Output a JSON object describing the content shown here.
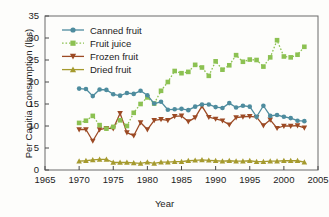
{
  "chart_data": {
    "type": "line",
    "title": "",
    "xlabel": "Year",
    "ylabel": "Per Capitia Consumption (lbs)",
    "xlim": [
      1965,
      2005
    ],
    "ylim": [
      0,
      35
    ],
    "xticks": [
      1965,
      1970,
      1975,
      1980,
      1985,
      1990,
      1995,
      2000,
      2005
    ],
    "yticks": [
      0,
      5,
      10,
      15,
      20,
      25,
      30,
      35
    ],
    "grid": false,
    "legend_position": "upper-left-inside",
    "x": [
      1970,
      1971,
      1972,
      1973,
      1974,
      1975,
      1976,
      1977,
      1978,
      1979,
      1980,
      1981,
      1982,
      1983,
      1984,
      1985,
      1986,
      1987,
      1988,
      1989,
      1990,
      1991,
      1992,
      1993,
      1994,
      1995,
      1996,
      1997,
      1998,
      1999,
      2000,
      2001,
      2002,
      2003
    ],
    "series": [
      {
        "name": "Canned fruit",
        "color": "#4e8c9e",
        "linestyle": "solid",
        "marker": "circle",
        "values": [
          18.5,
          18.4,
          16.8,
          18.3,
          18.2,
          17.2,
          16.9,
          17.5,
          17.3,
          18.0,
          17.0,
          15.1,
          15.5,
          13.7,
          13.8,
          13.9,
          13.6,
          14.4,
          14.9,
          14.9,
          14.3,
          14.1,
          15.2,
          14.2,
          14.6,
          14.4,
          12.1,
          14.6,
          12.3,
          12.5,
          12.1,
          11.8,
          11.2,
          11.1
        ]
      },
      {
        "name": "Fruit juice",
        "color": "#8cc152",
        "linestyle": "dotted",
        "marker": "square",
        "values": [
          10.7,
          11.2,
          12.3,
          10.2,
          9.4,
          9.8,
          11.3,
          10.0,
          13.0,
          15.0,
          16.5,
          15.1,
          18.0,
          20.0,
          22.5,
          22.0,
          22.3,
          23.9,
          23.3,
          21.4,
          24.7,
          22.8,
          23.8,
          26.1,
          24.6,
          25.1,
          25.0,
          23.5,
          25.6,
          29.5,
          25.8,
          25.6,
          26.2,
          28.0
        ]
      },
      {
        "name": "Frozen fruit",
        "color": "#9c4a24",
        "linestyle": "solid",
        "marker": "triangle-down",
        "values": [
          9.2,
          9.2,
          6.6,
          9.2,
          9.5,
          9.4,
          12.9,
          8.5,
          7.8,
          10.8,
          9.2,
          11.3,
          11.5,
          11.3,
          12.2,
          12.3,
          11.0,
          11.9,
          14.5,
          12.0,
          11.6,
          11.2,
          10.3,
          11.9,
          12.1,
          12.2,
          12.0,
          10.1,
          11.4,
          9.5,
          10.0,
          10.0,
          10.1,
          9.6
        ]
      },
      {
        "name": "Dried fruit",
        "color": "#a59a2e",
        "linestyle": "solid",
        "marker": "triangle-up",
        "values": [
          2.0,
          2.1,
          2.3,
          2.4,
          2.4,
          1.7,
          1.7,
          1.7,
          1.6,
          1.5,
          1.8,
          1.5,
          1.8,
          1.8,
          1.9,
          1.9,
          2.1,
          2.2,
          2.3,
          2.2,
          2.1,
          2.0,
          2.1,
          2.0,
          2.0,
          2.1,
          1.9,
          1.9,
          2.0,
          2.0,
          2.1,
          2.1,
          2.1,
          1.8
        ]
      }
    ]
  }
}
